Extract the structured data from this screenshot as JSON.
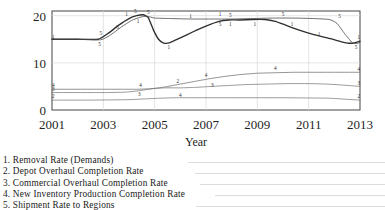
{
  "chart_data": {
    "type": "line",
    "title": "",
    "xlabel": "Year",
    "ylabel": "",
    "xlim": [
      2001,
      2013
    ],
    "ylim": [
      0,
      21
    ],
    "grid": true,
    "legend_position": "below-left",
    "xticks": [
      "2001",
      "2003",
      "2005",
      "2007",
      "2009",
      "2011",
      "2013"
    ],
    "xtick_values": [
      2001,
      2003,
      2005,
      2007,
      2009,
      2011,
      2013
    ],
    "yticks": [
      "0",
      "10",
      "20"
    ],
    "ytick_values": [
      0,
      10,
      20
    ],
    "series": [
      {
        "name": "Removal Rate (Demands)",
        "key": "1",
        "x": [
          2001,
          2002,
          2002.8,
          2003.2,
          2003.6,
          2004.0,
          2004.3,
          2004.55,
          2004.75,
          2004.95,
          2005.15,
          2005.35,
          2005.6,
          2006.0,
          2006.5,
          2007.0,
          2007.5,
          2007.9,
          2008.3,
          2008.8,
          2009.3,
          2009.7,
          2010.1,
          2010.6,
          2011.2,
          2011.8,
          2012.2,
          2012.5,
          2012.75,
          2013.0
        ],
        "values": [
          15.0,
          15.0,
          15.0,
          16.3,
          18.0,
          19.4,
          20.0,
          20.2,
          19.6,
          17.0,
          15.0,
          14.2,
          14.3,
          15.3,
          16.6,
          17.8,
          18.8,
          19.1,
          19.1,
          19.2,
          19.2,
          18.8,
          18.0,
          17.0,
          16.0,
          15.2,
          14.6,
          14.2,
          14.2,
          14.6
        ]
      },
      {
        "name": "Depot Overhaul Completion Rate",
        "key": "2",
        "x": [
          2001,
          2002.5,
          2003.4,
          2004.0,
          2004.6,
          2005.2,
          2005.8,
          2006.4,
          2007.0,
          2008.0,
          2009.0,
          2010.0,
          2011.0,
          2011.8,
          2012.4,
          2013.0
        ],
        "values": [
          2.1,
          2.1,
          2.15,
          2.2,
          2.35,
          2.5,
          2.6,
          2.6,
          2.6,
          2.6,
          2.6,
          2.6,
          2.55,
          2.5,
          2.3,
          2.1
        ]
      },
      {
        "name": "Commercial Overhaul Completion Rate",
        "key": "3",
        "x": [
          2001,
          2002.4,
          2003.2,
          2003.9,
          2004.4,
          2004.9,
          2005.4,
          2006.0,
          2006.6,
          2007.2,
          2007.9,
          2008.6,
          2009.4,
          2010.2,
          2011.0,
          2011.7,
          2012.3,
          2013.0
        ],
        "values": [
          3.7,
          3.7,
          3.7,
          3.8,
          4.1,
          4.5,
          4.7,
          4.7,
          4.8,
          5.0,
          5.2,
          5.4,
          5.5,
          5.6,
          5.6,
          5.5,
          5.3,
          5.0
        ]
      },
      {
        "name": "New Inventory Production Completion Rate",
        "key": "4",
        "x": [
          2001,
          2002.2,
          2003.0,
          2003.8,
          2004.3,
          2004.8,
          2005.3,
          2005.9,
          2006.5,
          2007.1,
          2007.7,
          2008.3,
          2009.0,
          2009.7,
          2010.4,
          2011.2,
          2012.0,
          2012.6,
          2013.0
        ],
        "values": [
          4.4,
          4.4,
          4.4,
          4.4,
          4.4,
          4.5,
          4.8,
          5.4,
          6.0,
          6.6,
          7.1,
          7.5,
          7.8,
          7.9,
          8.0,
          8.0,
          8.0,
          8.0,
          8.0
        ]
      },
      {
        "name": "Shipment Rate to Regions",
        "key": "5",
        "x": [
          2001,
          2002.2,
          2002.9,
          2003.25,
          2003.7,
          2004.1,
          2004.45,
          2004.7,
          2005.0,
          2005.6,
          2006.4,
          2007.2,
          2008.0,
          2008.8,
          2009.6,
          2010.4,
          2011.2,
          2011.8,
          2012.1,
          2012.4,
          2012.7,
          2012.9,
          2013.0
        ],
        "values": [
          15.0,
          15.0,
          14.9,
          15.8,
          17.6,
          19.0,
          19.7,
          19.9,
          19.5,
          19.4,
          19.3,
          19.3,
          19.3,
          19.4,
          19.5,
          19.5,
          19.4,
          19.2,
          18.4,
          16.2,
          14.3,
          14.1,
          14.4
        ]
      }
    ],
    "inline_point_labels": [
      {
        "key": "1",
        "x": 2001.05,
        "y": 15.0
      },
      {
        "key": "5",
        "x": 2002.85,
        "y": 13.6
      },
      {
        "key": "5",
        "x": 2002.9,
        "y": 15.9
      },
      {
        "key": "5",
        "x": 2003.55,
        "y": 17.2
      },
      {
        "key": "1",
        "x": 2003.9,
        "y": 19.9
      },
      {
        "key": "5",
        "x": 2004.25,
        "y": 20.5
      },
      {
        "key": "1",
        "x": 2004.35,
        "y": 18.4
      },
      {
        "key": "5",
        "x": 2004.75,
        "y": 20.3
      },
      {
        "key": "1",
        "x": 2005.55,
        "y": 13.0
      },
      {
        "key": "1",
        "x": 2006.4,
        "y": 19.6
      },
      {
        "key": "5",
        "x": 2007.55,
        "y": 17.9
      },
      {
        "key": "1",
        "x": 2007.55,
        "y": 19.9
      },
      {
        "key": "1",
        "x": 2007.95,
        "y": 17.9
      },
      {
        "key": "5",
        "x": 2007.95,
        "y": 19.7
      },
      {
        "key": "1",
        "x": 2008.9,
        "y": 17.9
      },
      {
        "key": "5",
        "x": 2010.0,
        "y": 19.9
      },
      {
        "key": "1",
        "x": 2010.35,
        "y": 17.8
      },
      {
        "key": "1",
        "x": 2011.4,
        "y": 15.6
      },
      {
        "key": "5",
        "x": 2012.2,
        "y": 19.6
      },
      {
        "key": "1",
        "x": 2012.95,
        "y": 15.1
      },
      {
        "key": "5",
        "x": 2012.85,
        "y": 12.9
      },
      {
        "key": "4",
        "x": 2001.05,
        "y": 4.9
      },
      {
        "key": "3",
        "x": 2001.05,
        "y": 4.0
      },
      {
        "key": "2",
        "x": 2001.05,
        "y": 2.5
      },
      {
        "key": "4",
        "x": 2004.45,
        "y": 4.9
      },
      {
        "key": "3",
        "x": 2004.4,
        "y": 2.9
      },
      {
        "key": "2",
        "x": 2005.9,
        "y": 5.7
      },
      {
        "key": "4",
        "x": 2006.0,
        "y": 2.7
      },
      {
        "key": "4",
        "x": 2007.0,
        "y": 6.9
      },
      {
        "key": "3",
        "x": 2007.25,
        "y": 4.9
      },
      {
        "key": "4",
        "x": 2009.7,
        "y": 8.5
      },
      {
        "key": "4",
        "x": 2012.95,
        "y": 8.3
      },
      {
        "key": "3",
        "x": 2012.95,
        "y": 5.4
      },
      {
        "key": "2",
        "x": 2012.95,
        "y": 2.5
      }
    ]
  },
  "axes": {
    "x_axis_title": "Year",
    "x_tick_labels": [
      "2001",
      "2003",
      "2005",
      "2007",
      "2009",
      "2011",
      "2013"
    ],
    "y_tick_labels": [
      "20",
      "10",
      "0"
    ]
  },
  "legend": {
    "items": [
      {
        "number": "1.",
        "label": "Removal Rate (Demands)",
        "full": "1. Removal Rate (Demands)"
      },
      {
        "number": "2.",
        "label": "Depot Overhaul Completion Rate",
        "full": "2. Depot Overhaul Completion Rate"
      },
      {
        "number": "3.",
        "label": "Commercial Overhaul Completion Rate",
        "full": "3. Commercial Overhaul Completion Rate"
      },
      {
        "number": "4.",
        "label": "New Inventory Production Completion Rate",
        "full": "4. New Inventory Production Completion Rate"
      },
      {
        "number": "5.",
        "label": "Shipment Rate to Regions",
        "full": "5. Shipment Rate to Regions"
      }
    ]
  },
  "colors": {
    "line_primary": "#2f2f2f",
    "line_secondary": "#6e6e6e",
    "grid": "#d9d9d9",
    "axis": "#555555",
    "text": "#1a1a1a"
  }
}
